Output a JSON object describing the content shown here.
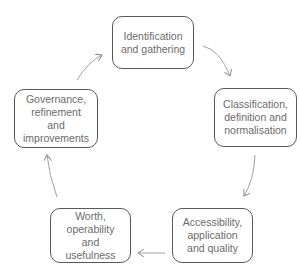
{
  "diagram": {
    "type": "cycle",
    "colors": {
      "border": "#595959",
      "text": "#6b6b6b",
      "arrow": "#8c8c8c",
      "background": "#ffffff"
    },
    "nodes": [
      {
        "id": "n1",
        "label": "Identification and gathering"
      },
      {
        "id": "n2",
        "label": "Classification, definition and normalisation"
      },
      {
        "id": "n3",
        "label": "Accessibility, application and quality"
      },
      {
        "id": "n4",
        "label": "Worth, operability and usefulness"
      },
      {
        "id": "n5",
        "label": "Governance, refinement and improvements"
      }
    ],
    "edges": [
      {
        "from": "n1",
        "to": "n2"
      },
      {
        "from": "n2",
        "to": "n3"
      },
      {
        "from": "n3",
        "to": "n4"
      },
      {
        "from": "n4",
        "to": "n5"
      },
      {
        "from": "n5",
        "to": "n1"
      }
    ]
  }
}
